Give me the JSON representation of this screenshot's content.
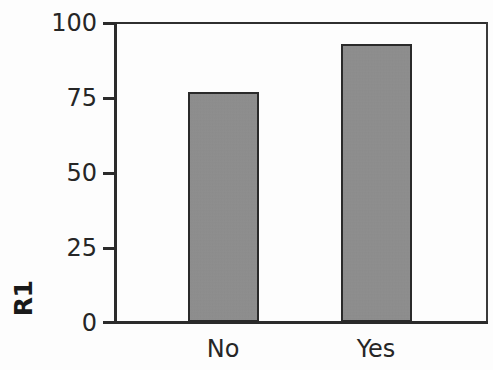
{
  "chart_data": {
    "type": "bar",
    "title": "",
    "subtitle": "",
    "xlabel": "",
    "ylabel": "R1",
    "categories": [
      "No",
      "Yes"
    ],
    "values": [
      77,
      93
    ],
    "series": [
      {
        "name": "R1",
        "values": [
          77,
          93
        ]
      }
    ],
    "ylim": [
      0,
      100
    ],
    "yticks": [
      0,
      25,
      50,
      75,
      100
    ],
    "ytick_labels": [
      "0",
      "25",
      "50",
      "75",
      "100"
    ],
    "grid": false,
    "legend": null,
    "annotations": [],
    "bar_fill_color": "#8e8e8e",
    "bar_edge_color": "#2a2a2a",
    "axis_color": "#2b2b2b",
    "background_color": "#fdfdfd"
  },
  "axis": {
    "y_title": "R1",
    "tick_0": "0",
    "tick_25": "25",
    "tick_50": "50",
    "tick_75": "75",
    "tick_100": "100"
  },
  "categories": {
    "cat_0": "No",
    "cat_1": "Yes"
  }
}
